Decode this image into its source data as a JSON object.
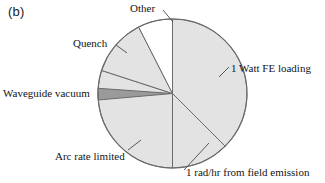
{
  "panel": {
    "tag": "(b)"
  },
  "chart_data": {
    "type": "pie",
    "title": "",
    "legend_position": "callout-labels",
    "grid": false,
    "note": "Angles measured clockwise from 12 o'clock position.",
    "slices": [
      {
        "label": "1 Watt FE loading",
        "value": 37.5,
        "start_angle": 0,
        "end_angle": 135,
        "color": "#e3e3e3"
      },
      {
        "label": "1 rad/hr from field emission",
        "value": 12.5,
        "start_angle": 135,
        "end_angle": 180,
        "color": "#e3e3e3"
      },
      {
        "label": "Arc rate limited",
        "value": 30.0,
        "start_angle": 180,
        "end_angle": 288,
        "color": "#e3e3e3"
      },
      {
        "label": "Waveguide vacuum",
        "value": 2.5,
        "start_angle": 265,
        "end_angle": 274,
        "color": "#9a9a9a"
      },
      {
        "label": "Quench",
        "value": 12.5,
        "start_angle": 288,
        "end_angle": 333,
        "color": "#e3e3e3"
      },
      {
        "label": "Other",
        "value": 7.5,
        "start_angle": 333,
        "end_angle": 360,
        "color": "#ffffff"
      }
    ],
    "labels": {
      "fe_loading": "1 Watt FE loading",
      "rad_per_hr": "1 rad/hr from field emission",
      "arc_rate": "Arc rate limited",
      "waveguide": "Waveguide vacuum",
      "quench": "Quench",
      "other": "Other"
    },
    "colors": {
      "slice_fill": "#e3e3e3",
      "slice_fill_dark": "#9a9a9a",
      "slice_fill_white": "#ffffff",
      "outline": "#6b6b6b",
      "leader": "#4a4a4a",
      "text": "#141414"
    }
  }
}
